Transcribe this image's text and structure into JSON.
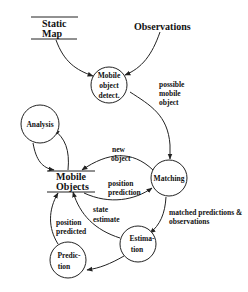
{
  "diagram": {
    "type": "data-flow diagram",
    "stores": {
      "static_map": {
        "line1": "Static",
        "line2": "Map"
      },
      "mobile_objects": {
        "line1": "Mobile",
        "line2": "Objects"
      }
    },
    "externals": {
      "observations": "Observations"
    },
    "processes": {
      "detect": {
        "line1": "Mobile",
        "line2": "object",
        "line3": "detect."
      },
      "analysis": {
        "label": "Analysis"
      },
      "matching": {
        "label": "Matching"
      },
      "estimation": {
        "line1": "Estima-",
        "line2": "tion"
      },
      "prediction": {
        "line1": "Predic-",
        "line2": "tion"
      }
    },
    "edges": {
      "possible_mobile_object": {
        "line1": "possible",
        "line2": "mobile",
        "line3": "object"
      },
      "new_object": {
        "line1": "new",
        "line2": "object"
      },
      "position_prediction": {
        "line1": "position",
        "line2": "prediction"
      },
      "matched": {
        "line1": "matched predictions &",
        "line2": "observations"
      },
      "state_estimate": {
        "line1": "state",
        "line2": "estimate"
      },
      "position_predicted": {
        "line1": "position",
        "line2": "predicted"
      }
    },
    "connections": [
      {
        "from": "Static Map",
        "to": "Mobile object detect."
      },
      {
        "from": "Observations",
        "to": "Mobile object detect."
      },
      {
        "from": "Mobile object detect.",
        "to": "Matching",
        "label": "possible mobile object"
      },
      {
        "from": "Matching",
        "to": "Mobile Objects",
        "label": "new object"
      },
      {
        "from": "Mobile Objects",
        "to": "Matching",
        "label": "position prediction"
      },
      {
        "from": "Matching",
        "to": "Estimation",
        "label": "matched predictions & observations"
      },
      {
        "from": "Estimation",
        "to": "Mobile Objects",
        "label": "state estimate"
      },
      {
        "from": "Estimation",
        "to": "Prediction"
      },
      {
        "from": "Prediction",
        "to": "Mobile Objects",
        "label": "position predicted"
      },
      {
        "from": "Mobile Objects",
        "to": "Analysis"
      },
      {
        "from": "Analysis",
        "to": "Mobile Objects"
      }
    ]
  }
}
